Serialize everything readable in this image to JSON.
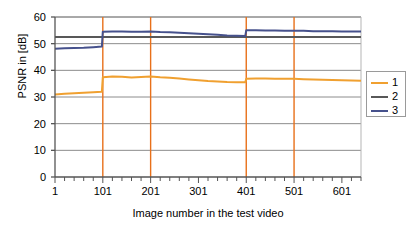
{
  "chart_data": {
    "type": "line",
    "title": "",
    "xlabel": "Image number in the test video",
    "ylabel": "PSNR in [dB]",
    "xlim": [
      1,
      641
    ],
    "ylim": [
      0,
      60
    ],
    "yticks": [
      0,
      10,
      20,
      30,
      40,
      50,
      60
    ],
    "xticks": [
      1,
      101,
      201,
      301,
      401,
      501,
      601
    ],
    "grid": true,
    "grid_axis": "y",
    "legend_position": "right",
    "minor_tick_step": 20,
    "vertical_markers": [
      101,
      201,
      401,
      501
    ],
    "vertical_marker_color": "#e8701a",
    "series": [
      {
        "name": "1",
        "color": "#f0a030",
        "x": [
          1,
          21,
          41,
          61,
          81,
          99,
          101,
          121,
          141,
          161,
          181,
          201,
          221,
          241,
          261,
          281,
          301,
          321,
          341,
          361,
          381,
          399,
          401,
          421,
          441,
          461,
          481,
          501,
          521,
          541,
          561,
          581,
          601,
          621,
          641
        ],
        "values": [
          30.9,
          31.2,
          31.4,
          31.6,
          31.8,
          32.0,
          37.4,
          37.7,
          37.6,
          37.3,
          37.5,
          37.7,
          37.4,
          37.2,
          36.9,
          36.6,
          36.3,
          36.0,
          35.8,
          35.6,
          35.5,
          35.5,
          36.8,
          36.9,
          36.9,
          36.8,
          36.8,
          36.8,
          36.7,
          36.6,
          36.5,
          36.4,
          36.3,
          36.2,
          36.1
        ]
      },
      {
        "name": "2",
        "color": "#585858",
        "x": [
          1,
          101,
          201,
          301,
          401,
          501,
          601,
          641
        ],
        "values": [
          52.5,
          52.5,
          52.5,
          52.5,
          52.5,
          52.5,
          52.5,
          52.5
        ]
      },
      {
        "name": "3",
        "color": "#46518c",
        "x": [
          1,
          21,
          41,
          61,
          81,
          99,
          101,
          121,
          141,
          161,
          181,
          201,
          221,
          241,
          261,
          281,
          301,
          321,
          341,
          361,
          381,
          399,
          401,
          421,
          441,
          461,
          481,
          501,
          521,
          541,
          561,
          581,
          601,
          621,
          641
        ],
        "values": [
          48.1,
          48.3,
          48.4,
          48.5,
          48.7,
          48.9,
          54.5,
          54.6,
          54.6,
          54.5,
          54.5,
          54.6,
          54.4,
          54.3,
          54.1,
          53.9,
          53.7,
          53.5,
          53.3,
          53.1,
          53.0,
          52.9,
          55.0,
          55.0,
          54.9,
          54.9,
          54.8,
          54.8,
          54.8,
          54.7,
          54.7,
          54.7,
          54.6,
          54.6,
          54.6
        ]
      }
    ]
  },
  "legend": {
    "entries": [
      {
        "label": "1",
        "color": "#f0a030"
      },
      {
        "label": "2",
        "color": "#585858"
      },
      {
        "label": "3",
        "color": "#46518c"
      }
    ]
  }
}
